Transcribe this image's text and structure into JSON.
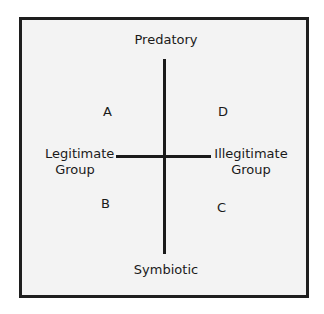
{
  "diagram": {
    "axes": {
      "top": "Predatory",
      "bottom": "Symbiotic",
      "left": [
        "Legitimate",
        "Group"
      ],
      "right": [
        "Illegitimate",
        "Group"
      ]
    },
    "quadrants": {
      "top_left": "A",
      "bottom_left": "B",
      "bottom_right": "C",
      "top_right": "D"
    },
    "colors": {
      "line": "#1a1a1a",
      "border": "#1e1e1e",
      "background": "#f3f3f3"
    }
  }
}
